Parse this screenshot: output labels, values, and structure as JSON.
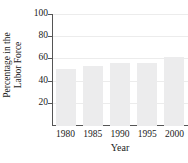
{
  "chart_data": {
    "type": "bar",
    "title": "",
    "xlabel": "Year",
    "ylabel_line1": "Percentage in the",
    "ylabel_line2": "Labor Force",
    "categories": [
      "1980",
      "1985",
      "1990",
      "1995",
      "2000"
    ],
    "values": [
      51,
      54,
      57,
      57,
      62
    ],
    "ylim": [
      0,
      100
    ],
    "yticks": [
      20,
      40,
      60,
      80,
      100
    ],
    "grid": true,
    "legend": "none",
    "colors": {
      "bar_fill": "#ececed",
      "axis": "#555555",
      "grid": "#ececec",
      "text": "#1a1a1a"
    }
  }
}
